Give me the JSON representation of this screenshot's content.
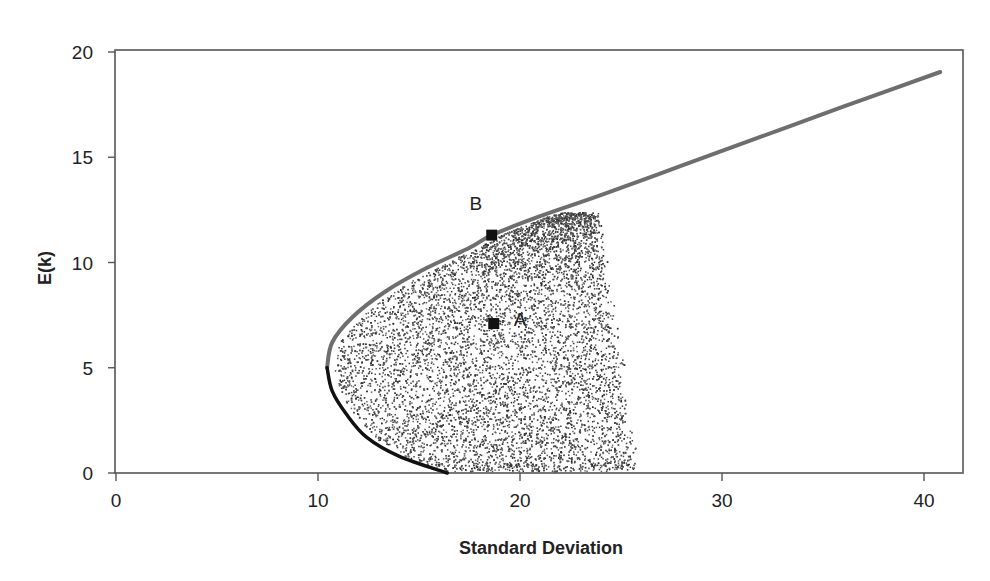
{
  "chart_data": {
    "type": "scatter",
    "title": "",
    "xlabel": "Standard Deviation",
    "ylabel": "E(k)",
    "xlim": [
      0,
      42.5
    ],
    "ylim": [
      0,
      20
    ],
    "x_ticks": [
      0,
      10,
      20,
      30,
      40
    ],
    "y_ticks": [
      0,
      5,
      10,
      15,
      20
    ],
    "grid": false,
    "legend": null,
    "series": [
      {
        "name": "Efficient frontier (upper branch)",
        "type": "line",
        "color": "#6e6e6e",
        "points": [
          [
            10.45,
            5.0
          ],
          [
            10.7,
            6.2
          ],
          [
            11.7,
            7.4
          ],
          [
            13.3,
            8.6
          ],
          [
            15.3,
            9.7
          ],
          [
            17.5,
            10.7
          ],
          [
            18.6,
            11.3
          ],
          [
            21.0,
            12.2
          ],
          [
            24.0,
            13.2
          ],
          [
            28.0,
            14.6
          ],
          [
            32.0,
            16.0
          ],
          [
            36.0,
            17.4
          ],
          [
            40.8,
            19.05
          ]
        ]
      },
      {
        "name": "Minimum-variance frontier (lower branch)",
        "type": "line",
        "color": "#111111",
        "points": [
          [
            10.45,
            5.0
          ],
          [
            10.7,
            3.9
          ],
          [
            11.4,
            2.8
          ],
          [
            12.4,
            1.7
          ],
          [
            14.0,
            0.8
          ],
          [
            16.4,
            0.0
          ]
        ]
      },
      {
        "name": "Feasible portfolios",
        "type": "scatter",
        "color": "#333333",
        "region": {
          "e_min": 0.0,
          "e_max": 12.4,
          "right_boundary": [
            [
              23.9,
              12.4
            ],
            [
              24.9,
              7.0
            ],
            [
              25.6,
              3.0
            ],
            [
              25.8,
              0.3
            ]
          ]
        }
      }
    ],
    "annotations": [
      {
        "label": "A",
        "x": 18.7,
        "y": 7.1,
        "marker": "square"
      },
      {
        "label": "B",
        "x": 18.6,
        "y": 11.3,
        "marker": "square"
      }
    ]
  },
  "axes": {
    "x_title": "Standard Deviation",
    "y_title": "E(k)",
    "x_tick_labels": [
      "0",
      "10",
      "20",
      "30",
      "40"
    ],
    "y_tick_labels": [
      "0",
      "5",
      "10",
      "15",
      "20"
    ]
  },
  "points": {
    "a_label": "A",
    "b_label": "B"
  }
}
